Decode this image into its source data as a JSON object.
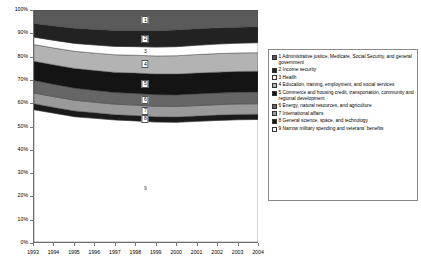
{
  "chart_data": {
    "type": "area",
    "title": "",
    "xlabel": "",
    "ylabel": "",
    "stacked": true,
    "normalized": true,
    "grid": false,
    "legend_position": "right",
    "ylim": [
      0,
      100
    ],
    "ytick_labels": [
      "100%",
      "90%",
      "80%",
      "70%",
      "60%",
      "50%",
      "40%",
      "30%",
      "20%",
      "10%",
      "0%"
    ],
    "ytick_values": [
      100,
      90,
      80,
      70,
      60,
      50,
      40,
      30,
      20,
      10,
      0
    ],
    "categories": [
      "1993",
      "1994",
      "1995",
      "1996",
      "1997",
      "1998",
      "1999",
      "2000",
      "2001",
      "2002",
      "2003",
      "2004"
    ],
    "x": [
      1993,
      1994,
      1995,
      1996,
      1997,
      1998,
      1999,
      2000,
      2001,
      2002,
      2003,
      2004
    ],
    "series": [
      {
        "key": "9",
        "name": "Narrow military spending and veterans' benefits",
        "swatch": "#ffffff",
        "pattern": "solid",
        "values": [
          57.0,
          55.5,
          54.0,
          53.3,
          52.6,
          52.2,
          51.7,
          51.6,
          52.0,
          52.4,
          52.7,
          52.8
        ]
      },
      {
        "key": "8",
        "name": "General science, space, and technology",
        "swatch": "#1a1a1a",
        "pattern": "solid",
        "values": [
          2.6,
          2.5,
          2.5,
          2.4,
          2.3,
          2.3,
          2.3,
          2.3,
          2.3,
          2.3,
          2.3,
          2.3
        ]
      },
      {
        "key": "7",
        "name": "International affairs",
        "swatch": "#9a9a9a",
        "pattern": "solid",
        "values": [
          4.6,
          4.6,
          4.6,
          4.5,
          4.5,
          4.5,
          4.5,
          4.5,
          4.5,
          4.5,
          4.5,
          4.5
        ]
      },
      {
        "key": "6",
        "name": "Energy, natural resources,  and agriculture",
        "swatch": "#666666",
        "pattern": "solid",
        "values": [
          5.4,
          5.3,
          5.2,
          5.1,
          5.0,
          5.0,
          5.0,
          5.0,
          5.0,
          5.0,
          5.0,
          5.0
        ]
      },
      {
        "key": "5",
        "name": "Commerce and housing credit, transportation, community and regional development",
        "swatch": "#141414",
        "pattern": "solid",
        "values": [
          8.3,
          8.4,
          8.5,
          8.6,
          8.7,
          8.8,
          8.9,
          9.0,
          9.0,
          9.0,
          9.0,
          9.0
        ]
      },
      {
        "key": "4",
        "name": "Education, training, employment, and social services",
        "swatch": "#b3b3b3",
        "pattern": "solid",
        "values": [
          7.2,
          7.3,
          7.4,
          7.5,
          7.6,
          7.7,
          7.8,
          7.9,
          8.0,
          8.0,
          8.0,
          8.0
        ]
      },
      {
        "key": "3",
        "name": "Health",
        "swatch": "#ffffff",
        "pattern": "solid",
        "values": [
          3.2,
          3.3,
          3.4,
          3.5,
          3.6,
          3.7,
          3.8,
          3.9,
          4.0,
          4.1,
          4.2,
          4.3
        ]
      },
      {
        "key": "2",
        "name": "Income security",
        "swatch": "#222222",
        "pattern": "solid",
        "values": [
          5.9,
          6.2,
          6.5,
          6.7,
          6.9,
          7.0,
          7.1,
          7.2,
          7.1,
          7.0,
          6.9,
          6.9
        ]
      },
      {
        "key": "1",
        "name": "Administrative justice, Medicare, Social Security, and general government",
        "swatch": "#5a5a5a",
        "pattern": "solid",
        "values": [
          5.8,
          6.9,
          7.9,
          8.4,
          8.8,
          8.8,
          8.9,
          8.6,
          8.1,
          7.7,
          7.4,
          7.2
        ]
      }
    ],
    "band_labels": [
      {
        "key": "1",
        "label": "1"
      },
      {
        "key": "2",
        "label": "2"
      },
      {
        "key": "3",
        "label": "3"
      },
      {
        "key": "4",
        "label": "4"
      },
      {
        "key": "5",
        "label": "5"
      },
      {
        "key": "6",
        "label": "6"
      },
      {
        "key": "7",
        "label": "7"
      },
      {
        "key": "8",
        "label": "8"
      },
      {
        "key": "9",
        "label": "9"
      }
    ]
  },
  "legend": {
    "items": [
      {
        "marker": "1",
        "label": "1 Administrative justice, Medicare, Social Security, and general government",
        "swatch": "#5a5a5a"
      },
      {
        "marker": "2",
        "label": "2 Income security",
        "swatch": "#222222"
      },
      {
        "marker": "3",
        "label": "3 Health",
        "swatch": "#ffffff"
      },
      {
        "marker": "4",
        "label": "4 Education, training, employment, and social services",
        "swatch": "#b3b3b3"
      },
      {
        "marker": "5",
        "label": "5 Commerce and housing credit, transportation, community and regional development",
        "swatch": "#141414"
      },
      {
        "marker": "6",
        "label": "6 Energy, natural resources,  and agriculture",
        "swatch": "#666666"
      },
      {
        "marker": "7",
        "label": "7 International affairs",
        "swatch": "#9a9a9a"
      },
      {
        "marker": "8",
        "label": "8 General science, space, and technology",
        "swatch": "#1a1a1a"
      },
      {
        "marker": "9",
        "label": "9 Narrow military spending and veterans' benefits",
        "swatch": "#ffffff"
      }
    ]
  }
}
